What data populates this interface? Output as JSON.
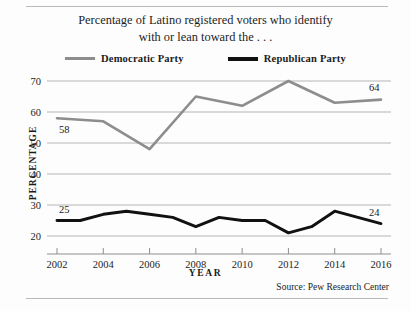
{
  "figure": {
    "title_line_1": "Percentage of Latino registered voters who identify",
    "title_line_2": "with or lean toward the . . .",
    "source": "Source:  Pew Research Center"
  },
  "legend": {
    "items": [
      {
        "label": "Democratic Party",
        "color": "#8d8d8d",
        "swatch": "line-swatch-gray"
      },
      {
        "label": "Republican Party",
        "color": "#111111",
        "swatch": "line-swatch-black"
      }
    ]
  },
  "axes": {
    "x_title": "YEAR",
    "y_title": "PERCENTAGE",
    "y_ticks": [
      "20",
      "30",
      "40",
      "50",
      "60",
      "70"
    ],
    "x_ticks": [
      "2002",
      "2004",
      "2006",
      "2008",
      "2010",
      "2012",
      "2014",
      "2016"
    ]
  },
  "annotations": [
    {
      "name": "democratic-start-value",
      "text": "58"
    },
    {
      "name": "democratic-end-value",
      "text": "64"
    },
    {
      "name": "republican-start-value",
      "text": "25"
    },
    {
      "name": "republican-end-value",
      "text": "24"
    }
  ],
  "chart_data": {
    "type": "line",
    "title": "Percentage of Latino registered voters who identify with or lean toward the . . .",
    "xlabel": "YEAR",
    "ylabel": "PERCENTAGE",
    "xlim": [
      2002,
      2016
    ],
    "ylim": [
      20,
      70
    ],
    "grid": true,
    "legend_position": "top-center",
    "source": "Source:  Pew Research Center",
    "x": [
      2002,
      2003,
      2004,
      2005,
      2006,
      2007,
      2008,
      2009,
      2010,
      2011,
      2012,
      2013,
      2014,
      2015,
      2016
    ],
    "series": [
      {
        "name": "Democratic Party",
        "color": "#8d8d8d",
        "x": [
          2002,
          2004,
          2006,
          2008,
          2010,
          2012,
          2014,
          2016
        ],
        "values": [
          58,
          57,
          48,
          65,
          62,
          70,
          63,
          64
        ],
        "labels": {
          "2002": "58",
          "2016": "64"
        }
      },
      {
        "name": "Republican Party",
        "color": "#111111",
        "x": [
          2002,
          2003,
          2004,
          2005,
          2006,
          2007,
          2008,
          2009,
          2010,
          2011,
          2012,
          2013,
          2014,
          2015,
          2016
        ],
        "values": [
          25,
          25,
          27,
          28,
          27,
          26,
          23,
          26,
          25,
          25,
          21,
          23,
          28,
          26,
          24
        ],
        "labels": {
          "2002": "25",
          "2016": "24"
        }
      }
    ]
  },
  "geometry": {
    "plot_left": 47,
    "plot_right": 391,
    "y_for_70": 81,
    "y_for_20": 236,
    "x_for_2002": 57,
    "x_for_2016": 381
  }
}
